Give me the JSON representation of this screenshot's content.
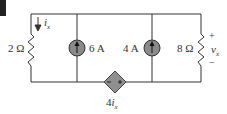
{
  "circuit": {
    "resistor_left": {
      "label": "2 Ω"
    },
    "source_1": {
      "label": "6 A"
    },
    "source_2": {
      "label": "4 A"
    },
    "resistor_right": {
      "label": "8 Ω"
    },
    "current_label": "i",
    "current_sub": "x",
    "voltage_label": "v",
    "voltage_sub": "x",
    "plus": "+",
    "minus": "−",
    "dependent_source": {
      "coef": "4",
      "var": "i",
      "sub": "x"
    },
    "colors": {
      "wire": "#333333",
      "source_fill": "#8a8a8a",
      "diamond_fill": "#8f8f8f"
    }
  }
}
